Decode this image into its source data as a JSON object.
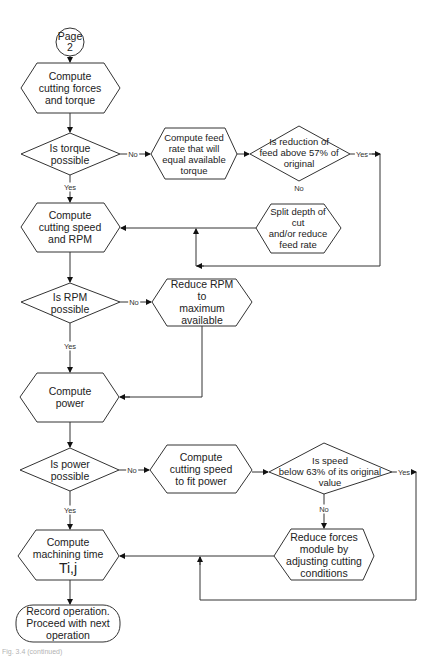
{
  "diagram": {
    "type": "flowchart",
    "connector_start": "Page\n2",
    "nodes": {
      "page_connector": {
        "line1": "Page",
        "line2": "2"
      },
      "compute_forces": {
        "line1": "Compute",
        "line2": "cutting forces",
        "line3": "and torque"
      },
      "is_torque_possible": {
        "line1": "Is torque",
        "line2": "possible"
      },
      "compute_feed_rate": {
        "line1": "Compute feed",
        "line2": "rate that will",
        "line3": "equal available",
        "line4": "torque"
      },
      "is_reduction_feed": {
        "line1": "Is reduction of",
        "line2": "feed above 57% of",
        "line3": "original"
      },
      "split_depth": {
        "line1": "Split depth of",
        "line2": "cut",
        "line3": "and/or reduce",
        "line4": "feed rate"
      },
      "compute_speed_rpm": {
        "line1": "Compute",
        "line2": "cutting speed",
        "line3": "and RPM"
      },
      "is_rpm_possible": {
        "line1": "Is RPM",
        "line2": "possible"
      },
      "reduce_rpm": {
        "line1": "Reduce RPM",
        "line2": "to",
        "line3": "maximum",
        "line4": "available"
      },
      "compute_power": {
        "line1": "Compute",
        "line2": "power"
      },
      "is_power_possible": {
        "line1": "Is power",
        "line2": "possible"
      },
      "compute_speed_fit_power": {
        "line1": "Compute",
        "line2": "cutting speed",
        "line3": "to fit power"
      },
      "is_speed_below": {
        "line1": "Is speed",
        "line2": "below 63% of its original",
        "line3": "value"
      },
      "reduce_forces": {
        "line1": "Reduce forces",
        "line2": "module by",
        "line3": "adjusting cutting",
        "line4": "conditions"
      },
      "compute_machining_time": {
        "line1": "Compute",
        "line2": "machining time",
        "line3": "Ti,j"
      },
      "record_operation": {
        "line1": "Record operation.",
        "line2": "Proceed with next",
        "line3": "operation"
      }
    },
    "edge_labels": {
      "torque_no": "No",
      "torque_yes": "Yes",
      "reduction_yes": "Yes",
      "reduction_no": "No",
      "rpm_no": "No",
      "rpm_yes": "Yes",
      "power_no": "No",
      "power_yes": "Yes",
      "speed_yes": "Yes",
      "speed_no": "No"
    },
    "caption": "Fig. 3.4 (continued)"
  }
}
